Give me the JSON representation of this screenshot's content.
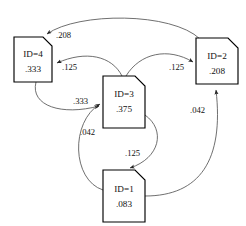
{
  "diagram": {
    "type": "directed-graph",
    "title": "",
    "background_color": "#ffffff",
    "node_fill_color": "#ffffff",
    "node_stroke_color": "#000000",
    "edge_color": "#555555",
    "nodes": [
      {
        "id": "4",
        "label": "ID=4",
        "value": ".333",
        "x": 14,
        "y": 37,
        "w": 38,
        "h": 45
      },
      {
        "id": "2",
        "label": "ID=2",
        "value": ".208",
        "x": 196,
        "y": 38,
        "w": 42,
        "h": 46
      },
      {
        "id": "3",
        "label": "ID=3",
        "value": ".375",
        "x": 103,
        "y": 76,
        "w": 42,
        "h": 52
      },
      {
        "id": "1",
        "label": "ID=1",
        "value": ".083",
        "x": 103,
        "y": 170,
        "w": 42,
        "h": 52
      }
    ],
    "edges": [
      {
        "from": "2",
        "to": "4",
        "label": ".208",
        "label_x": 56,
        "label_y": 38
      },
      {
        "from": "3",
        "to": "4",
        "label": ".125",
        "label_x": 72,
        "label_y": 70
      },
      {
        "from": "4",
        "to": "3",
        "label": ".333",
        "label_x": 85,
        "label_y": 104
      },
      {
        "from": "3",
        "to": "2",
        "label": ".125",
        "label_x": 181,
        "label_y": 70
      },
      {
        "from": "1",
        "to": "3",
        "label": ".042",
        "label_x": 88,
        "label_y": 135
      },
      {
        "from": "3",
        "to": "1",
        "label": ".125",
        "label_x": 137,
        "label_y": 156
      },
      {
        "from": "1",
        "to": "2",
        "label": ".042",
        "label_x": 198,
        "label_y": 113
      }
    ]
  }
}
